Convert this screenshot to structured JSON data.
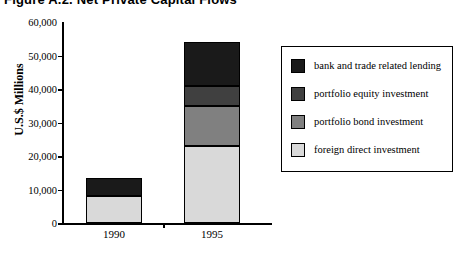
{
  "figure": {
    "title": "Figure A.2.  Net Private Capital Flows"
  },
  "chart_data": {
    "type": "bar",
    "title": "Figure A.2.  Net Private Capital Flows",
    "stacked": true,
    "xlabel": "",
    "ylabel": "U.S.$ Millions",
    "categories": [
      "1990",
      "1995"
    ],
    "ylim": [
      0,
      60000
    ],
    "ytick_values": [
      0,
      10000,
      20000,
      30000,
      40000,
      50000,
      60000
    ],
    "ytick_labels": [
      "0",
      "10,000",
      "20,000",
      "30,000",
      "40,000",
      "50,000",
      "60,000"
    ],
    "grid": false,
    "legend_position": "right",
    "series": [
      {
        "name": "foreign direct investment",
        "color": "#d9d9d9",
        "values": [
          8000,
          23000
        ]
      },
      {
        "name": "portfolio bond investment",
        "color": "#808080",
        "values": [
          0,
          12000
        ]
      },
      {
        "name": "portfolio equity investment",
        "color": "#404040",
        "values": [
          0,
          6000
        ]
      },
      {
        "name": "bank and trade related lending",
        "color": "#1a1a1a",
        "values": [
          5300,
          13000
        ]
      }
    ],
    "totals": [
      13300,
      54000
    ]
  },
  "axis": {
    "y_title": "U.S.$ Millions",
    "y_ticks": [
      {
        "label": "60,000",
        "value": 60000
      },
      {
        "label": "50,000",
        "value": 50000
      },
      {
        "label": "40,000",
        "value": 40000
      },
      {
        "label": "30,000",
        "value": 30000
      },
      {
        "label": "20,000",
        "value": 20000
      },
      {
        "label": "10,000",
        "value": 10000
      },
      {
        "label": "0",
        "value": 0
      }
    ],
    "x_ticks": [
      {
        "label": "1990"
      },
      {
        "label": "1995"
      }
    ]
  },
  "legend": {
    "items": [
      {
        "label": "bank and trade related lending",
        "color": "#1a1a1a"
      },
      {
        "label": "portfolio equity investment",
        "color": "#404040"
      },
      {
        "label": "portfolio bond investment",
        "color": "#808080"
      },
      {
        "label": "foreign direct investment",
        "color": "#d9d9d9"
      }
    ]
  }
}
